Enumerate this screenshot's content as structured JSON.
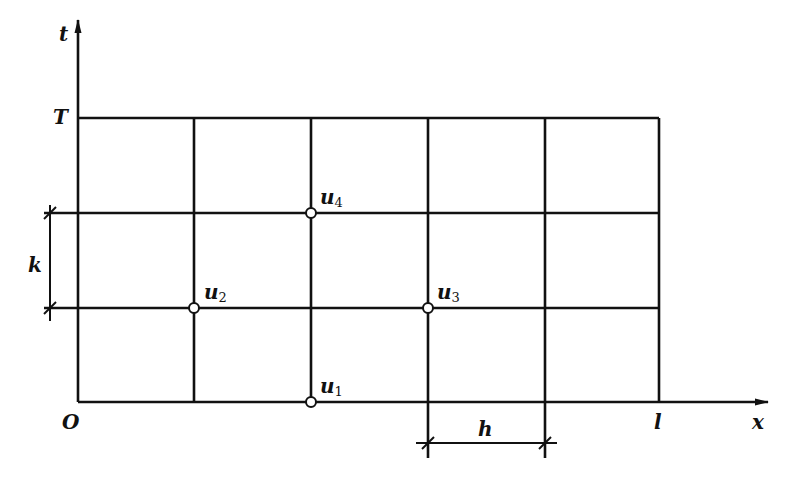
{
  "diagram": {
    "axes": {
      "t_label": "t",
      "x_label": "x",
      "origin_label": "O",
      "T_label": "T",
      "l_label": "l"
    },
    "dimensions": {
      "k_label": "k",
      "h_label": "h"
    },
    "nodes": [
      {
        "name": "u",
        "sub": "1"
      },
      {
        "name": "u",
        "sub": "2"
      },
      {
        "name": "u",
        "sub": "3"
      },
      {
        "name": "u",
        "sub": "4"
      }
    ],
    "grid": {
      "columns": 5,
      "rows": 3,
      "line_color": "#111111"
    }
  }
}
